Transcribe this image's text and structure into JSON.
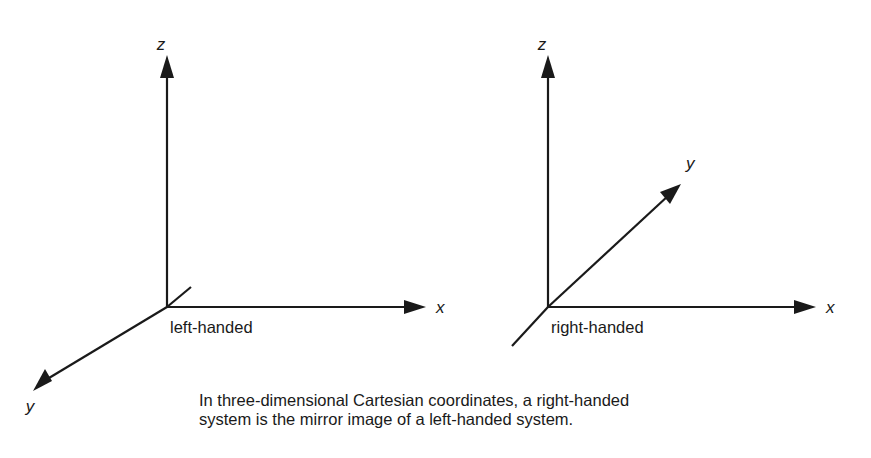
{
  "figure": {
    "background_color": "#ffffff",
    "line_color": "#1a1a1a",
    "text_color": "#1a1a1a"
  },
  "diagrams": [
    {
      "id": "left-handed",
      "system_label": "left-handed",
      "origin": {
        "x": 167,
        "y": 307
      },
      "axes": [
        {
          "name": "z",
          "label": "z",
          "label_pos": {
            "x": 161,
            "y": 50
          },
          "direction": "up",
          "tip": {
            "x": 167,
            "y": 55
          },
          "arrow": true
        },
        {
          "name": "x",
          "label": "x",
          "label_pos": {
            "x": 436,
            "y": 313
          },
          "direction": "right",
          "tip": {
            "x": 426,
            "y": 307
          },
          "arrow": true
        },
        {
          "name": "y",
          "label": "y",
          "label_pos": {
            "x": 30,
            "y": 412
          },
          "direction": "down-left",
          "tip": {
            "x": 33,
            "y": 391
          },
          "stub_end": {
            "x": 191,
            "y": 287
          },
          "arrow": true
        }
      ]
    },
    {
      "id": "right-handed",
      "system_label": "right-handed",
      "origin": {
        "x": 548,
        "y": 307
      },
      "axes": [
        {
          "name": "z",
          "label": "z",
          "label_pos": {
            "x": 542,
            "y": 50
          },
          "direction": "up",
          "tip": {
            "x": 548,
            "y": 55
          },
          "arrow": true
        },
        {
          "name": "x",
          "label": "x",
          "label_pos": {
            "x": 826,
            "y": 313
          },
          "direction": "right",
          "tip": {
            "x": 816,
            "y": 307
          },
          "arrow": true
        },
        {
          "name": "y",
          "label": "y",
          "label_pos": {
            "x": 686,
            "y": 169
          },
          "direction": "up-right",
          "tip": {
            "x": 681,
            "y": 184
          },
          "stub_end": {
            "x": 512,
            "y": 346
          },
          "arrow": true
        }
      ]
    }
  ],
  "system_labels": [
    {
      "text": "left-handed",
      "x": 170,
      "y": 333
    },
    {
      "text": "right-handed",
      "x": 551,
      "y": 333
    }
  ],
  "caption": {
    "lines": [
      "In three-dimensional Cartesian coordinates, a right-handed",
      "system is the mirror image of a left-handed system."
    ],
    "x": 199,
    "line1_y": 406,
    "line2_y": 425
  }
}
